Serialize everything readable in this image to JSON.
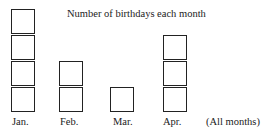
{
  "chart_data": {
    "type": "pictograph",
    "title": "Number of birthdays each month",
    "categories": [
      "Jan.",
      "Feb.",
      "Mar.",
      "Apr."
    ],
    "values": [
      4,
      2,
      1,
      3
    ],
    "xlabel": "(All months)",
    "ylabel": "",
    "unit": "one box = one birthday"
  },
  "title": "Number of birthdays each month",
  "columns": [
    {
      "label": "Jan.",
      "count": 4,
      "left": 11,
      "label_left": 12
    },
    {
      "label": "Feb.",
      "count": 2,
      "left": 59,
      "label_left": 60
    },
    {
      "label": "Mar.",
      "count": 1,
      "left": 110,
      "label_left": 113
    },
    {
      "label": "Apr.",
      "count": 3,
      "left": 163,
      "label_left": 163
    }
  ],
  "axis_note": "(All months)"
}
